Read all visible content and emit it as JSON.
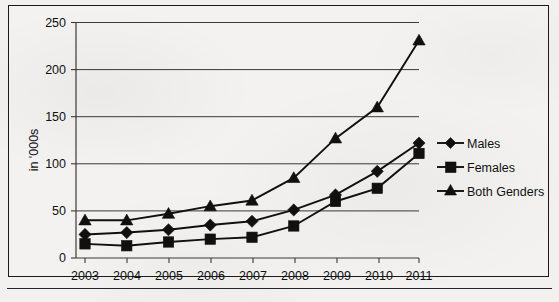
{
  "chart_data": {
    "type": "line",
    "title": "",
    "subtitle": "",
    "xlabel": "",
    "ylabel": "in '000s",
    "categories": [
      "2003",
      "2004",
      "2005",
      "2006",
      "2007",
      "2008",
      "2009",
      "2010",
      "2011"
    ],
    "x": [
      2003,
      2004,
      2005,
      2006,
      2007,
      2008,
      2009,
      2010,
      2011
    ],
    "ylim": [
      0,
      250
    ],
    "yticks": [
      0,
      50,
      100,
      150,
      200,
      250
    ],
    "ytick_labels": [
      "0",
      "50",
      "100",
      "150",
      "200",
      "250"
    ],
    "grid": true,
    "legend_position": "right",
    "series": [
      {
        "name": "Males",
        "marker": "diamond",
        "color": "#101010",
        "values": [
          25,
          27,
          30,
          35,
          39,
          51,
          67,
          92,
          122
        ]
      },
      {
        "name": "Females",
        "marker": "square",
        "color": "#101010",
        "values": [
          15,
          13,
          17,
          20,
          22,
          34,
          60,
          74,
          111
        ]
      },
      {
        "name": "Both Genders",
        "marker": "triangle",
        "color": "#101010",
        "values": [
          40,
          40,
          47,
          55,
          61,
          85,
          127,
          160,
          231
        ]
      }
    ]
  },
  "legend": {
    "items": [
      {
        "label": "Males",
        "marker": "diamond"
      },
      {
        "label": "Females",
        "marker": "square"
      },
      {
        "label": "Both Genders",
        "marker": "triangle"
      }
    ]
  },
  "axes": {
    "y_title": "in '000s",
    "y_labels": [
      "250",
      "200",
      "150",
      "100",
      "50",
      "0"
    ],
    "x_labels": [
      "2003",
      "2004",
      "2005",
      "2006",
      "2007",
      "2008",
      "2009",
      "2010",
      "2011"
    ]
  },
  "colors": {
    "ink": "#101010",
    "grid": "#3a3a3a",
    "paper": "#f2f1ef",
    "frame": "#1b1b1b"
  }
}
